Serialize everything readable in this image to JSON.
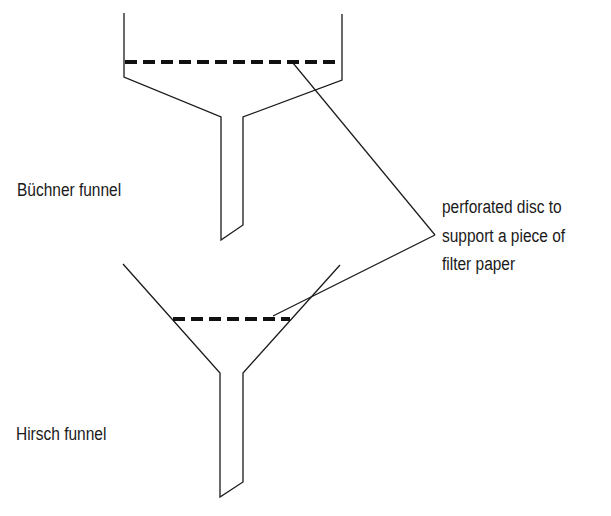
{
  "diagram": {
    "type": "labelled-apparatus-diagram",
    "labels": {
      "buchner": "Büchner funnel",
      "hirsch": "Hirsch funnel"
    },
    "annotation": {
      "lines": [
        "perforated disc to",
        "support a piece of",
        "filter paper"
      ]
    },
    "colors": {
      "stroke": "#1a1a1a",
      "background": "#ffffff"
    }
  }
}
